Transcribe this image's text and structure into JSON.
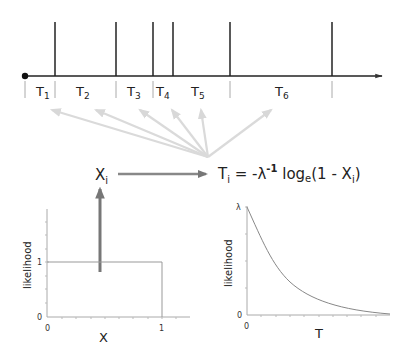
{
  "timeline": {
    "origin_x": 25,
    "axis_y": 76,
    "axis_end_x": 382,
    "spike_top_y": 22,
    "event_times_px": [
      55,
      116,
      153,
      173,
      230,
      332
    ],
    "separators_px": [
      25,
      55,
      116,
      153,
      230,
      332
    ],
    "intervals": [
      {
        "label": "T",
        "sub": "1",
        "x": 38
      },
      {
        "label": "T",
        "sub": "2",
        "x": 77
      },
      {
        "label": "T",
        "sub": "3",
        "x": 128
      },
      {
        "label": "T",
        "sub": "4",
        "x": 157
      },
      {
        "label": "T",
        "sub": "5",
        "x": 191
      },
      {
        "label": "T",
        "sub": "6",
        "x": 275
      }
    ]
  },
  "fan_arrows": {
    "origin": [
      208,
      157
    ],
    "targets": [
      [
        52,
        109
      ],
      [
        96,
        109
      ],
      [
        140,
        109
      ],
      [
        172,
        109
      ],
      [
        201,
        109
      ],
      [
        271,
        109
      ]
    ],
    "color": "#d8d8d8"
  },
  "sample": {
    "label": "X",
    "sub": "i"
  },
  "formula": {
    "lhs": "T",
    "lhs_sub": "i",
    "eq": " = -λ",
    "exp": "-1",
    "log": " log",
    "log_sub": "e",
    "arg_open": "(1 - X",
    "arg_sub": "i",
    "arg_close": ")"
  },
  "left_plot": {
    "ylabel": "likelihood",
    "xlabel": "X",
    "y_ticks": [
      "0",
      "1"
    ],
    "x_ticks": [
      "0",
      "1"
    ],
    "type": "uniform"
  },
  "right_plot": {
    "ylabel": "likelihood",
    "xlabel": "T",
    "y_ticks": [
      "0",
      "λ"
    ],
    "x_ticks": [
      "0"
    ],
    "type": "exponential"
  },
  "colors": {
    "axis": "#222222",
    "arrow_dark": "#777777",
    "plot_line": "#888888",
    "fan": "#d8d8d8"
  }
}
